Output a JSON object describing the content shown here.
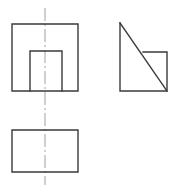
{
  "sheet": {
    "title": "Orthographic projection exercise",
    "background_color": "#ffffff",
    "width": 175,
    "height": 192
  },
  "styles": {
    "visible_edge_color": "#3a3a3a",
    "visible_edge_width": 1.4,
    "center_line_color": "#b0b0b0",
    "center_line_width": 1.2,
    "center_line_dash": "13 3 2 3"
  },
  "views": {
    "front_view": {
      "name": "front-view",
      "label": "Front view",
      "outer_square": {
        "x1": 12,
        "y1": 24,
        "x2": 78,
        "y2": 91
      },
      "inner_rectangle": {
        "x1": 30,
        "y1": 51,
        "x2": 62,
        "y2": 91
      },
      "inner_rectangle_path": "M 30 91 L 30 51 L 62 51 L 62 91",
      "outer_square_path": "M 12 24 L 78 24 L 78 91 L 12 91 Z"
    },
    "side_view": {
      "name": "side-view",
      "label": "Side view",
      "outline_path": "M 120 23 L 120 91 L 167 91 L 167 52 L 143 52",
      "diagonal_path": "M 120 23 L 167 91",
      "apex": {
        "x": 120,
        "y": 23
      },
      "bottom_left": {
        "x": 120,
        "y": 91
      },
      "bottom_right": {
        "x": 167,
        "y": 91
      },
      "step_corner": {
        "x": 167,
        "y": 52
      },
      "step_inner": {
        "x": 143,
        "y": 52
      }
    },
    "top_view": {
      "name": "top-view",
      "label": "Top view",
      "rectangle": {
        "x1": 12,
        "y1": 130,
        "x2": 78,
        "y2": 172
      },
      "rectangle_path": "M 12 130 L 78 130 L 78 172 L 12 172 Z"
    }
  },
  "center_lines": {
    "vertical": {
      "name": "vertical-center-line",
      "label": "Vertical centerline",
      "path": "M 45 8 L 45 185",
      "x": 45,
      "y_start": 8,
      "y_end": 185
    }
  }
}
